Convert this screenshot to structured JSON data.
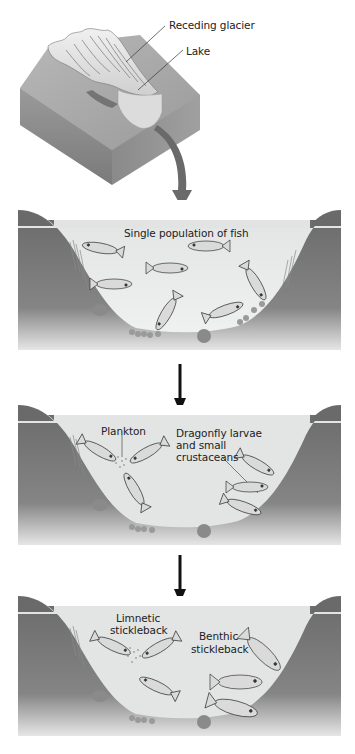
{
  "figure": {
    "top_block": {
      "labels": {
        "receding_glacier": "Receding glacier",
        "lake": "Lake"
      }
    },
    "panels": [
      {
        "id": "panel-1",
        "labels": [
          "Single population of fish"
        ]
      },
      {
        "id": "panel-2",
        "labels": {
          "plankton": "Plankton",
          "dragonfly_line1": "Dragonfly larvae",
          "dragonfly_line2": "and small",
          "dragonfly_line3": "crustaceans"
        }
      },
      {
        "id": "panel-3",
        "labels": {
          "limnetic_line1": "Limnetic",
          "limnetic_line2": "stickleback",
          "benthic_line1": "Benthic",
          "benthic_line2": "stickleback"
        }
      }
    ],
    "arrows": [
      "curved-arrow-block-to-panel-1",
      "down-arrow-panel-1-to-2",
      "down-arrow-panel-2-to-3"
    ],
    "colors": {
      "bank": "#6e6e6e",
      "bank_dark": "#5a5a5a",
      "water": "#e4e6e6",
      "water_bottom": "#f2f2f2",
      "ground_top": "#a9a9a9",
      "ground_side": "#8a8a8a",
      "fish": "#d9d9d9",
      "fish_outline": "#333333",
      "arrow_gray": "#6a6a6a",
      "arrow_black": "#111111",
      "text": "#222222"
    }
  }
}
